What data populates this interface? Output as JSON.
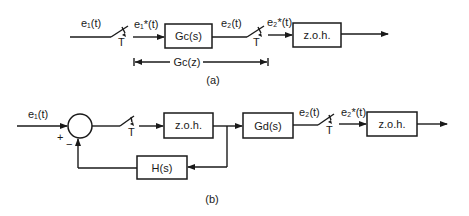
{
  "diagram_a": {
    "caption": "(a)",
    "input_signal": "e₁(t)",
    "sampled_signal_1": "e₁*(t)",
    "switch_1_label": "T",
    "block_gc": "Gc(s)",
    "intermediate_signal": "e₂(t)",
    "switch_2_label": "T",
    "sampled_signal_2": "e₂*(t)",
    "block_zoh": "z.o.h.",
    "bracket_label": "Gc(z)"
  },
  "diagram_b": {
    "caption": "(b)",
    "input_signal": "e₁(t)",
    "sum_plus": "+",
    "sum_minus": "−",
    "switch_1_label": "T",
    "block_zoh_1": "z.o.h.",
    "block_gd": "Gd(s)",
    "intermediate_signal": "e₂(t)",
    "switch_2_label": "T",
    "sampled_signal_2": "e₂*(t)",
    "block_zoh_2": "z.o.h.",
    "block_feedback": "H(s)"
  },
  "colors": {
    "ink": "#1a1a1a",
    "background": "#ffffff"
  }
}
